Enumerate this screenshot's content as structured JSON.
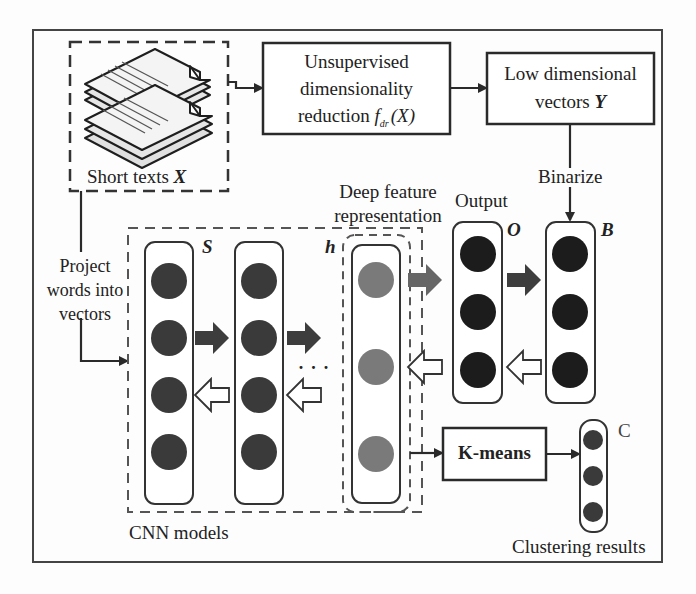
{
  "diagram": {
    "inputs": {
      "short_texts_label": "Short texts ",
      "short_texts_var": "X",
      "project_label_lines": [
        "Project",
        "words into",
        "vectors"
      ]
    },
    "dim_reduction": {
      "lines": [
        "Unsupervised",
        "dimensionality",
        "reduction "
      ],
      "func": "f",
      "func_sub": "dr",
      "func_arg": "(X)"
    },
    "low_dim": {
      "lines": [
        "Low dimensional",
        "vectors "
      ],
      "var": "Y"
    },
    "binarize_label": "Binarize",
    "deep_feature_label_lines": [
      "Deep feature",
      "representation"
    ],
    "output_label": "Output",
    "symbols": {
      "S": "S",
      "h": "h",
      "O": "O",
      "B": "B",
      "C": "C"
    },
    "kmeans_label": "K-means",
    "cnn_label": "CNN models",
    "clustering_label": "Clustering results",
    "ellipsis": "· · ·",
    "colors": {
      "node_dark": "#3a3a3a",
      "node_black": "#1c1c1c",
      "node_gray": "#7a7a7a",
      "arrow_fill": "#3d3d3d",
      "border": "#333333",
      "dashed": "#555555"
    }
  }
}
